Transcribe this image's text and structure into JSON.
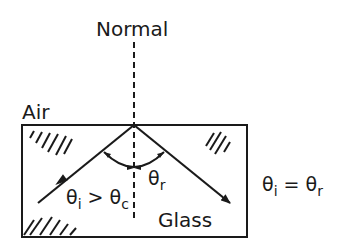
{
  "diagram": {
    "labels": {
      "normal": "Normal",
      "air": "Air",
      "glass": "Glass",
      "theta_r": "θ",
      "theta_r_sub": "r",
      "incidence_cond_theta1": "θ",
      "incidence_cond_sub1": "i",
      "incidence_cond_op": " > ",
      "incidence_cond_theta2": "θ",
      "incidence_cond_sub2": "c",
      "equality_theta1": "θ",
      "equality_sub1": "i",
      "equality_op": " = ",
      "equality_theta2": "θ",
      "equality_sub2": "r"
    },
    "colors": {
      "ink": "#1a1a1a",
      "background": "#ffffff"
    }
  }
}
